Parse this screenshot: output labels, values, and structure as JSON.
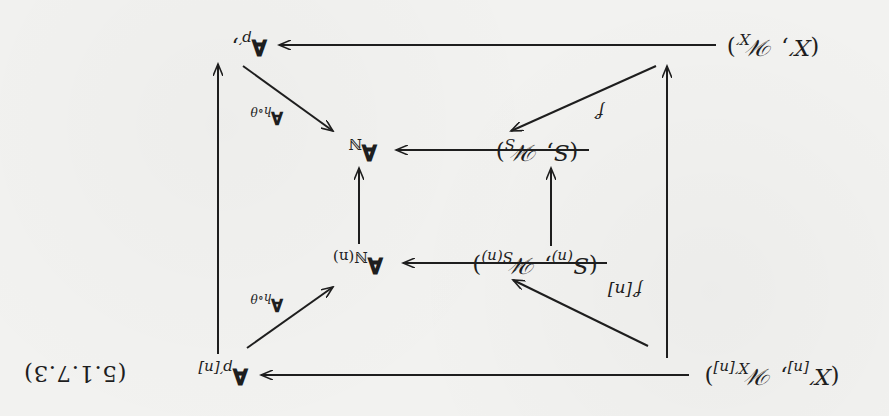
{
  "orientation": "rotated 180 degrees",
  "diagram": {
    "nodes": {
      "x_prime": {
        "open": "(",
        "base": "X′",
        "sep": ", ",
        "script": "𝒲",
        "sub": "X′",
        "close": ")"
      },
      "a_p_prime": {
        "base": "𝐀",
        "sub": "p′",
        "trail": ","
      },
      "s": {
        "open": "(",
        "base": "S",
        "sep": ", ",
        "script": "𝒲",
        "sub": "S",
        "close": ")"
      },
      "a_n": {
        "base": "𝐀",
        "sub": "ℕ"
      },
      "s_n": {
        "open": "(",
        "base": "S",
        "base_sub": "(n)",
        "sep": ", ",
        "script": "𝒲",
        "sub": "S(n)",
        "close": ")"
      },
      "a_n_n": {
        "base": "𝐀",
        "sub": "ℕ(n)"
      },
      "x_prime_n": {
        "open": "(",
        "base": "X′",
        "base_sub": "[n]",
        "sep": ", ",
        "script": "𝒲",
        "sub": "X′[n]",
        "close": ")"
      },
      "a_p_prime_n": {
        "base": "𝐀",
        "sub": "p′[n]"
      }
    },
    "labels": {
      "f_prime": "f′",
      "f_prime_n": "f′[n]",
      "a_h_theta_top": {
        "base": "𝐀",
        "sub": "h∘θ"
      },
      "a_h_theta_bottom": {
        "base": "𝐀",
        "sub": "h∘θ"
      }
    },
    "equation_number": "(5.1.7.3)"
  },
  "colors": {
    "paper": "#f2f2f0",
    "ink": "#1e1e1e"
  }
}
